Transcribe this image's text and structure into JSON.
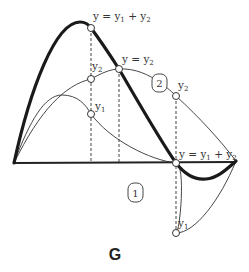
{
  "figure": {
    "label": "G",
    "stroke_color": "#222222",
    "dash_color": "#444444",
    "background": "#ffffff"
  },
  "labels": {
    "sum_top": {
      "y": "y",
      "eq": " = ",
      "y1": "y",
      "sub1": "1",
      "plus": " + ",
      "y2": "y",
      "sub2": "2"
    },
    "sum_right": {
      "y": "y",
      "eq": " = ",
      "y1": "y",
      "sub1": "1",
      "plus": " + ",
      "y2": "y",
      "sub2": "2"
    },
    "y_eq_y2": {
      "y": "y",
      "eq": " = ",
      "y2": "y",
      "sub2": "2"
    },
    "y2_left": {
      "y": "y",
      "sub": "2"
    },
    "y1_left": {
      "y": "y",
      "sub": "1"
    },
    "y2_right": {
      "y": "y",
      "sub": "2"
    },
    "y1_bottom": {
      "y": "y",
      "sub": "1"
    }
  },
  "badges": [
    {
      "id": "curve-1",
      "text": "1"
    },
    {
      "id": "curve-2",
      "text": "2"
    }
  ],
  "curves": [
    {
      "name": "y1",
      "style": "thin",
      "description": "component wave 1"
    },
    {
      "name": "y2",
      "style": "thin",
      "description": "component wave 2"
    },
    {
      "name": "y1+y2",
      "style": "bold",
      "description": "resultant sum wave"
    }
  ]
}
